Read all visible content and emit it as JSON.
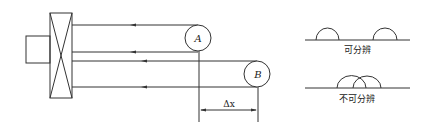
{
  "diagram": {
    "circle_a_label": "A",
    "circle_b_label": "B",
    "dimension_label": "Δx",
    "resolvable_label": "可分辨",
    "unresolvable_label": "不可分辨"
  },
  "colors": {
    "stroke": "#333333",
    "background": "#ffffff"
  }
}
